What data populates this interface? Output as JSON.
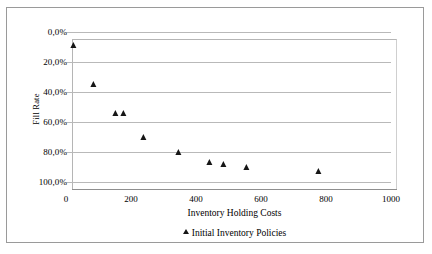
{
  "chart_data": {
    "type": "scatter",
    "title": "",
    "xlabel": "Inventory Holding Costs",
    "ylabel": "Fill Rate",
    "xlim": [
      0,
      1000
    ],
    "ylim": [
      0,
      100
    ],
    "y_axis_inverted": true,
    "y_unit": "%",
    "grid": true,
    "legend_position": "bottom",
    "xticks": [
      "0",
      "200",
      "400",
      "600",
      "800",
      "1000"
    ],
    "xtick_values": [
      0,
      200,
      400,
      600,
      800,
      1000
    ],
    "yticks": [
      "0,0%",
      "20,0%",
      "40,0%",
      "60,0%",
      "80,0%",
      "100,0%"
    ],
    "ytick_values": [
      0,
      20,
      40,
      60,
      80,
      100
    ],
    "series": [
      {
        "name": "Initial Inventory Policies",
        "marker": "triangle",
        "color": "#161616",
        "points": [
          {
            "x": 25,
            "y": 10
          },
          {
            "x": 87,
            "y": 36
          },
          {
            "x": 154,
            "y": 55
          },
          {
            "x": 178,
            "y": 55
          },
          {
            "x": 240,
            "y": 71
          },
          {
            "x": 348,
            "y": 81
          },
          {
            "x": 443,
            "y": 88
          },
          {
            "x": 486,
            "y": 89
          },
          {
            "x": 557,
            "y": 91
          },
          {
            "x": 778,
            "y": 94
          }
        ]
      }
    ]
  },
  "legend": {
    "entries": [
      {
        "label": "Initial Inventory Policies",
        "marker": "triangle-icon"
      }
    ]
  }
}
